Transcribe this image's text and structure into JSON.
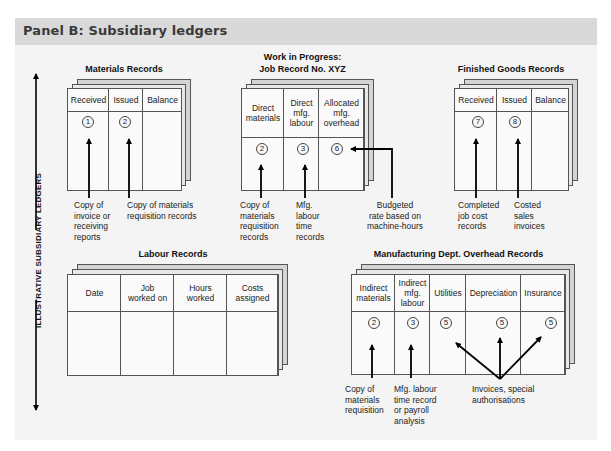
{
  "panel": {
    "title": "Panel B: Subsidiary ledgers",
    "axis_label": "ILLUSTRATIVE SUBSIDIARY LEDGERS",
    "colors": {
      "header_bg": "#d9d9d9",
      "panel_bg": "#f4f4f4",
      "line": "#000000"
    }
  },
  "materials": {
    "title": "Materials Records",
    "columns": [
      {
        "label": "Received",
        "marker": "1"
      },
      {
        "label": "Issued",
        "marker": "2"
      },
      {
        "label": "Balance",
        "marker": ""
      }
    ],
    "notes": [
      "Copy of\ninvoice or\nreceiving\nreports",
      "Copy of materials\nrequisition records"
    ]
  },
  "wip": {
    "title_line1": "Work in Progress:",
    "title_line2": "Job Record No. XYZ",
    "columns": [
      {
        "label": "Direct\nmaterials",
        "marker": "2"
      },
      {
        "label": "Direct\nmfg.\nlabour",
        "marker": "3"
      },
      {
        "label": "Allocated\nmfg.\noverhead",
        "marker": "6"
      }
    ],
    "notes": [
      "Copy of\nmaterials\nrequisition\nrecords",
      "Mfg.\nlabour\ntime\nrecords",
      "Budgeted\nrate based on\nmachine-hours"
    ]
  },
  "finished_goods": {
    "title": "Finished Goods Records",
    "columns": [
      {
        "label": "Received",
        "marker": "7"
      },
      {
        "label": "Issued",
        "marker": "8"
      },
      {
        "label": "Balance",
        "marker": ""
      }
    ],
    "notes": [
      "Completed\njob cost\nrecords",
      "Costed\nsales\ninvoices"
    ]
  },
  "labour": {
    "title": "Labour Records",
    "columns": [
      {
        "label": "Date"
      },
      {
        "label": "Job\nworked on"
      },
      {
        "label": "Hours\nworked"
      },
      {
        "label": "Costs\nassigned"
      }
    ]
  },
  "overhead": {
    "title": "Manufacturing Dept. Overhead Records",
    "columns": [
      {
        "label": "Indirect\nmaterials",
        "marker": "2"
      },
      {
        "label": "Indirect\nmfg.\nlabour",
        "marker": "3"
      },
      {
        "label": "Utilities",
        "marker": "5"
      },
      {
        "label": "Depreciation",
        "marker": "5"
      },
      {
        "label": "Insurance",
        "marker": "5"
      }
    ],
    "notes": [
      "Copy of\nmaterials\nrequisition",
      "Mfg. labour\ntime record\nor payroll\nanalysis",
      "Invoices, special\nauthorisations"
    ]
  }
}
